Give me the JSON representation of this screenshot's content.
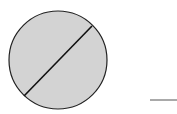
{
  "diagram": {
    "circle": {
      "cx": 58,
      "cy": 60,
      "r": 49,
      "fill": "#d3d3d3",
      "stroke": "#222222",
      "stroke_width": 1.2
    },
    "diameter_line": {
      "x1": 24,
      "y1": 96,
      "x2": 92,
      "y2": 26,
      "stroke": "#111111",
      "stroke_width": 1.6
    },
    "segment": {
      "x1": 150,
      "y1": 100,
      "x2": 177,
      "y2": 100,
      "stroke": "#555555",
      "stroke_width": 1
    }
  }
}
